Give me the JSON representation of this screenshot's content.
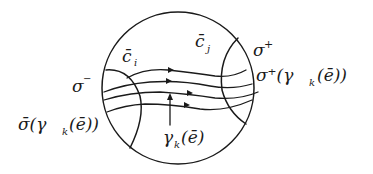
{
  "diagram": {
    "type": "hand-drawn topological diagram",
    "labels": {
      "c_i": "c̄",
      "c_i_sub": "i",
      "c_j": "c̄",
      "c_j_sub": "j",
      "sigma_minus": "σ",
      "sigma_minus_sup": "−",
      "sigma_plus": "σ",
      "sigma_plus_sup": "+",
      "sigma_plus_gamma": "σ⁺(γ",
      "sigma_plus_gamma_sub": "k",
      "sigma_plus_gamma_tail": "(ē))",
      "sigma_minus_gamma": "σ̄(γ",
      "sigma_minus_gamma_sub": "k",
      "sigma_minus_gamma_tail": "(ē))",
      "gamma_k": "γ",
      "gamma_k_sub": "k",
      "gamma_k_tail": "(ē)"
    },
    "elements": {
      "outer_circle": "disk boundary",
      "left_arc": "σ− boundary arc (c̄i side)",
      "right_arc": "σ+ boundary arc (c̄j side)",
      "flow_curves": 4,
      "pointer_arrow": "points to γk(ē) curve"
    },
    "colors": {
      "ink": "#1a1a1a",
      "background": "#ffffff"
    }
  }
}
